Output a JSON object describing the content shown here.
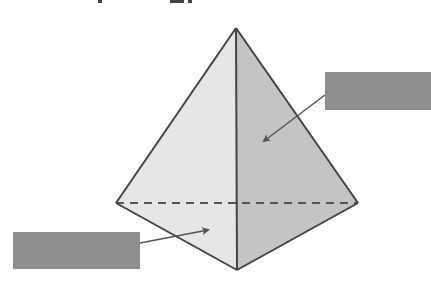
{
  "diagram": {
    "colors": {
      "left_face": "#e6e6e6",
      "right_face": "#c4c4c4",
      "edge": "#444444",
      "hidden_edge": "#555555",
      "arrow": "#555555",
      "label_box": "#8e8e8e",
      "background": "#ffffff"
    },
    "vertices": {
      "apex": [
        236,
        28
      ],
      "left": [
        116,
        203
      ],
      "right": [
        358,
        203
      ],
      "front": [
        237,
        270
      ]
    },
    "labels": [
      {
        "id": "label-right",
        "text": "",
        "target_face": "right-face",
        "arrow_from": [
          325,
          95
        ],
        "arrow_to": [
          262,
          142
        ]
      },
      {
        "id": "label-left",
        "text": "",
        "target_face": "left-face",
        "arrow_from": [
          140,
          243
        ],
        "arrow_to": [
          210,
          230
        ]
      }
    ],
    "hidden_edge": {
      "style": "dashed",
      "from": "left",
      "to": "right"
    }
  }
}
